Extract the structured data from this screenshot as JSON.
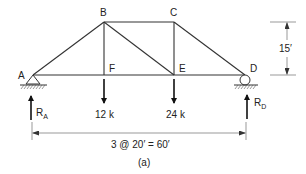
{
  "diagram": {
    "type": "truss",
    "caption": "(a)",
    "nodes": {
      "A": {
        "label": "A",
        "x": 33,
        "y": 75
      },
      "B": {
        "label": "B",
        "x": 104,
        "y": 22
      },
      "C": {
        "label": "C",
        "x": 174,
        "y": 22
      },
      "D": {
        "label": "D",
        "x": 245,
        "y": 75
      },
      "E": {
        "label": "E",
        "x": 174,
        "y": 75
      },
      "F": {
        "label": "F",
        "x": 104,
        "y": 75
      }
    },
    "members": [
      "AB",
      "BC",
      "CD",
      "AF",
      "FE",
      "ED",
      "BF",
      "BE",
      "CE"
    ],
    "loads": [
      {
        "node": "F",
        "label": "12 k",
        "value": 12,
        "unit": "k"
      },
      {
        "node": "E",
        "label": "24 k",
        "value": 24,
        "unit": "k"
      }
    ],
    "supports": [
      {
        "node": "A",
        "type": "pin"
      },
      {
        "node": "D",
        "type": "roller"
      }
    ],
    "reactions": [
      {
        "node": "A",
        "symbol": "R",
        "subscript": "A"
      },
      {
        "node": "D",
        "symbol": "R",
        "subscript": "D"
      }
    ],
    "dimensions": {
      "height": {
        "label": "15′"
      },
      "span": {
        "label": "3 @ 20′ = 60′"
      }
    }
  }
}
